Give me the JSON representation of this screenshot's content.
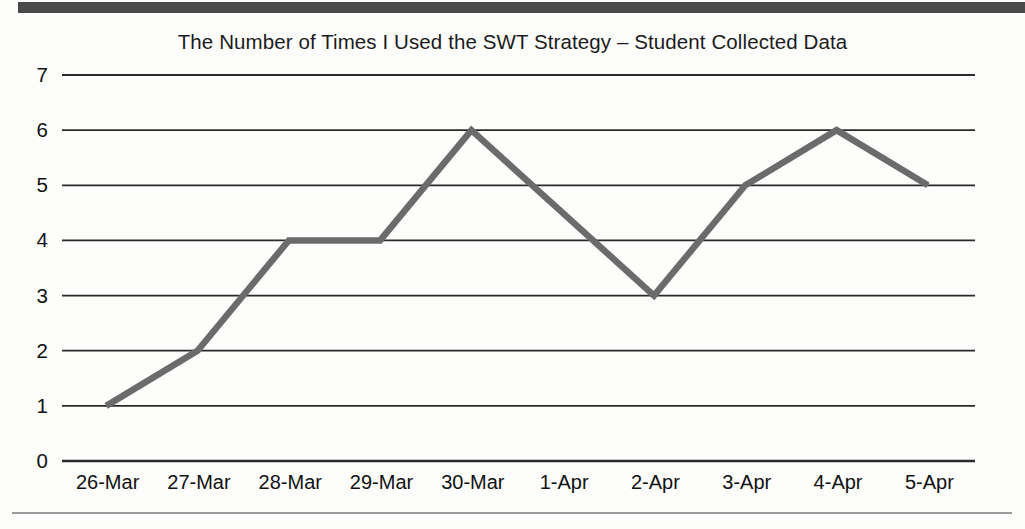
{
  "chart_data": {
    "type": "line",
    "title": "The Number of Times I Used the SWT Strategy – Student Collected Data",
    "xlabel": "",
    "ylabel": "",
    "categories": [
      "26-Mar",
      "27-Mar",
      "28-Mar",
      "29-Mar",
      "30-Mar",
      "1-Apr",
      "2-Apr",
      "3-Apr",
      "4-Apr",
      "5-Apr"
    ],
    "values": [
      1,
      2,
      4,
      4,
      6,
      4.5,
      3,
      5,
      6,
      5
    ],
    "series": [
      {
        "name": "Times Used SWT Strategy",
        "values": [
          1,
          2,
          4,
          4,
          6,
          4.5,
          3,
          5,
          6,
          5
        ]
      }
    ],
    "yticks": [
      0,
      1,
      2,
      3,
      4,
      5,
      6,
      7
    ],
    "ytick_labels": [
      "0",
      "1",
      "2",
      "3",
      "4",
      "5",
      "6",
      "7"
    ],
    "ylim": [
      0,
      7
    ],
    "grid": "horizontal",
    "legend": "none",
    "line_color": "#6b6b6b",
    "grid_color": "#2a2a2a",
    "text_color": "#111111",
    "background_color": "#fdfdfc"
  },
  "scan": {
    "top_edge_color": "#4a4a4a",
    "bottom_rule_color": "#9a9a9a"
  }
}
